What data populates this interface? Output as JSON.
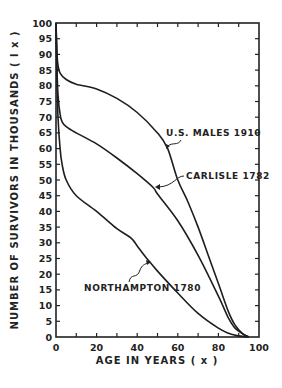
{
  "chart_data": {
    "type": "line",
    "title": "",
    "xlabel": "AGE IN YEARS (x)",
    "ylabel": "NUMBER OF SURVIVORS IN THOUSANDS (l x)",
    "xlim": [
      0,
      100
    ],
    "ylim": [
      0,
      100
    ],
    "grid": false,
    "x_ticks": [
      0,
      20,
      40,
      60,
      80,
      100
    ],
    "x_minor_ticks": [
      10,
      30,
      50,
      70,
      90
    ],
    "y_ticks": [
      0,
      5,
      10,
      15,
      20,
      25,
      30,
      35,
      40,
      45,
      50,
      55,
      60,
      65,
      70,
      75,
      80,
      85,
      90,
      95,
      100
    ],
    "legend": "inline annotations with leader arrows",
    "series": [
      {
        "name": "U.S. MALES 1910",
        "x": [
          0,
          0.5,
          1,
          2,
          5,
          10,
          20,
          30,
          40,
          50,
          55,
          60,
          65,
          70,
          75,
          80,
          85,
          88,
          92,
          95
        ],
        "values": [
          100,
          90,
          86.5,
          84,
          82,
          80.5,
          79,
          76,
          71.5,
          65,
          60,
          50,
          43,
          35,
          26,
          17,
          8,
          4,
          1,
          0
        ]
      },
      {
        "name": "CARLISLE 1782",
        "x": [
          0,
          0.5,
          1,
          2,
          3,
          5,
          10,
          20,
          30,
          40,
          48,
          50,
          60,
          70,
          80,
          85,
          88,
          92,
          95
        ],
        "values": [
          100,
          85,
          77,
          71,
          68.5,
          67,
          65,
          61.5,
          57,
          52,
          47.5,
          45.5,
          37,
          26,
          13,
          6,
          3,
          1,
          0
        ]
      },
      {
        "name": "NORTHAMPTON 1780",
        "x": [
          0,
          0.5,
          1,
          2,
          3,
          5,
          10,
          20,
          30,
          37,
          40,
          46,
          50,
          60,
          70,
          80,
          85,
          88,
          92,
          95
        ],
        "values": [
          100,
          82,
          70,
          60,
          55,
          50,
          45,
          40,
          34.5,
          31.5,
          29,
          24,
          21,
          14,
          7.5,
          2.8,
          1.2,
          0.6,
          0.2,
          0
        ]
      }
    ],
    "annotations": [
      {
        "text": "U.S. MALES 1910",
        "points_to": {
          "x": 54.5,
          "y": 60
        }
      },
      {
        "text": "CARLISLE 1782",
        "points_to": {
          "x": 48,
          "y": 47.5
        }
      },
      {
        "text": "NORTHAMPTON 1780",
        "points_to": {
          "x": 46,
          "y": 24
        }
      }
    ]
  },
  "labels": {
    "xlabel": "AGE IN YEARS ( x )",
    "ylabel": "NUMBER OF SURVIVORS IN THOUSANDS ( l x )",
    "us_males": "U.S. MALES 1910",
    "carlisle": "CARLISLE 1782",
    "northampton": "NORTHAMPTON 1780"
  }
}
